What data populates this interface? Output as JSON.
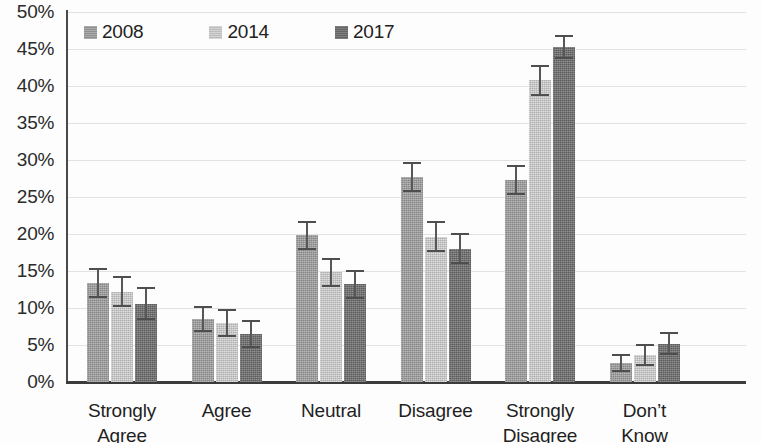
{
  "chart_data": {
    "type": "bar",
    "title": "",
    "xlabel": "",
    "ylabel": "",
    "ylim": [
      0,
      50
    ],
    "y_tick_labels": [
      "0%",
      "5%",
      "10%",
      "15%",
      "20%",
      "25%",
      "30%",
      "35%",
      "40%",
      "45%",
      "50%"
    ],
    "y_tick_values": [
      0,
      5,
      10,
      15,
      20,
      25,
      30,
      35,
      40,
      45,
      50
    ],
    "grid": true,
    "legend_position": "top-left",
    "categories": [
      "Strongly Agree",
      "Agree",
      "Neutral",
      "Disagree",
      "Strongly Disagree",
      "Don't Know"
    ],
    "category_lines": [
      [
        "Strongly",
        "Agree"
      ],
      [
        "Agree",
        ""
      ],
      [
        "Neutral",
        ""
      ],
      [
        "Disagree",
        ""
      ],
      [
        "Strongly",
        "Disagree"
      ],
      [
        "Don’t",
        "Know"
      ]
    ],
    "series": [
      {
        "name": "2008",
        "color": "#9a9a9a",
        "values": [
          13.4,
          8.5,
          19.8,
          27.7,
          27.3,
          2.6
        ],
        "errors": [
          2.0,
          1.8,
          1.9,
          2.0,
          2.0,
          1.2
        ]
      },
      {
        "name": "2014",
        "color": "#c9c9c9",
        "values": [
          12.2,
          8.0,
          14.8,
          19.6,
          40.8,
          3.6
        ],
        "errors": [
          2.1,
          1.9,
          2.0,
          2.1,
          2.1,
          1.5
        ]
      },
      {
        "name": "2017",
        "color": "#6e6e6e",
        "values": [
          10.6,
          6.5,
          13.2,
          18.0,
          45.3,
          5.2
        ],
        "errors": [
          2.2,
          1.9,
          2.0,
          2.1,
          1.6,
          1.6
        ]
      }
    ]
  },
  "legend": {
    "items": [
      {
        "label": "2008"
      },
      {
        "label": "2014"
      },
      {
        "label": "2017"
      }
    ]
  }
}
